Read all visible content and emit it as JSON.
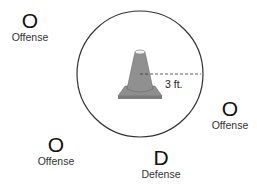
{
  "diagram": {
    "players": [
      {
        "mark": "O",
        "label": "Offense"
      },
      {
        "mark": "O",
        "label": "Offense"
      },
      {
        "mark": "O",
        "label": "Offense"
      },
      {
        "mark": "D",
        "label": "Defense"
      }
    ],
    "cone": {
      "name": "traffic-cone",
      "color": "#8a8a8a"
    },
    "radius_label": "3 ft.",
    "circle_color": "#333333"
  }
}
